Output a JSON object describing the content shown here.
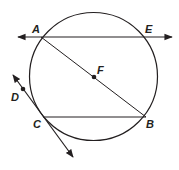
{
  "diagram": {
    "type": "geometry-circle",
    "colors": {
      "stroke": "#231f20",
      "background": "#ffffff"
    },
    "circle": {
      "center_label": "F",
      "cx": 93.5,
      "cy": 76.5,
      "r": 64
    },
    "points": [
      {
        "label": "A",
        "x": 41,
        "y": 37,
        "label_x": 32,
        "label_y": 33
      },
      {
        "label": "E",
        "x": 147,
        "y": 37,
        "label_x": 146,
        "label_y": 33
      },
      {
        "label": "F",
        "x": 94,
        "y": 77,
        "label_x": 97,
        "label_y": 74
      },
      {
        "label": "B",
        "x": 146,
        "y": 117,
        "label_x": 146,
        "label_y": 128
      },
      {
        "label": "C",
        "x": 43,
        "y": 117,
        "label_x": 33,
        "label_y": 128
      },
      {
        "label": "D",
        "x": 23,
        "y": 89,
        "label_x": 11,
        "label_y": 101
      }
    ],
    "segments": [
      {
        "name": "line-AE",
        "kind": "line",
        "x1": 18,
        "y1": 37,
        "x2": 172,
        "y2": 37
      },
      {
        "name": "diameter-AB",
        "kind": "segment",
        "x1": 41,
        "y1": 37,
        "x2": 146,
        "y2": 117
      },
      {
        "name": "chord-CB",
        "kind": "segment",
        "x1": 43,
        "y1": 117,
        "x2": 146,
        "y2": 117
      },
      {
        "name": "tangent-DC",
        "kind": "line",
        "x1": 13,
        "y1": 75,
        "x2": 73,
        "y2": 157
      }
    ]
  }
}
